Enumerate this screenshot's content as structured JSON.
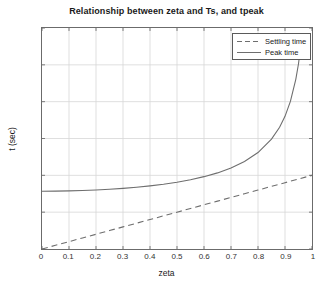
{
  "chart_data": {
    "type": "line",
    "title": "Relationship between zeta and Ts, and tpeak",
    "xlabel": "zeta",
    "ylabel": "t (sec)",
    "xlim": [
      0,
      1
    ],
    "ylim": [
      0,
      3
    ],
    "grid": true,
    "legend_position": "top-right",
    "xticks": [
      0,
      0.1,
      0.2,
      0.3,
      0.4,
      0.5,
      0.6,
      0.7,
      0.8,
      0.9,
      1
    ],
    "xtick_labels": [
      "0",
      "0.1",
      "0.2",
      "0.3",
      "0.4",
      "0.5",
      "0.6",
      "0.7",
      "0.8",
      "0.9",
      "1"
    ],
    "yticks": [
      0,
      0.5,
      1,
      1.5,
      2,
      2.5,
      3
    ],
    "ytick_labels": [
      "0",
      "0.5",
      "1",
      "1.5",
      "2",
      "2.5",
      "3"
    ],
    "series": [
      {
        "name": "Settling time",
        "style": "dashed",
        "color": "#6e6e6e",
        "x": [
          0,
          0.05,
          0.1,
          0.15,
          0.2,
          0.25,
          0.3,
          0.35,
          0.4,
          0.45,
          0.5,
          0.55,
          0.6,
          0.65,
          0.7,
          0.75,
          0.8,
          0.85,
          0.9,
          0.95,
          1
        ],
        "values": [
          0,
          0.05,
          0.1,
          0.15,
          0.2,
          0.25,
          0.3,
          0.35,
          0.4,
          0.45,
          0.5,
          0.55,
          0.6,
          0.65,
          0.7,
          0.75,
          0.8,
          0.85,
          0.9,
          0.95,
          1
        ]
      },
      {
        "name": "Peak time",
        "style": "solid",
        "color": "#6e6e6e",
        "x": [
          0,
          0.05,
          0.1,
          0.15,
          0.2,
          0.25,
          0.3,
          0.35,
          0.4,
          0.45,
          0.5,
          0.55,
          0.6,
          0.65,
          0.7,
          0.75,
          0.8,
          0.85,
          0.88,
          0.9,
          0.92,
          0.94,
          0.95,
          0.96
        ],
        "values": [
          0.785,
          0.786,
          0.789,
          0.794,
          0.801,
          0.811,
          0.823,
          0.838,
          0.857,
          0.879,
          0.907,
          0.941,
          0.982,
          1.033,
          1.1,
          1.187,
          1.309,
          1.491,
          1.653,
          1.801,
          2.004,
          2.304,
          2.515,
          2.804
        ]
      }
    ]
  }
}
